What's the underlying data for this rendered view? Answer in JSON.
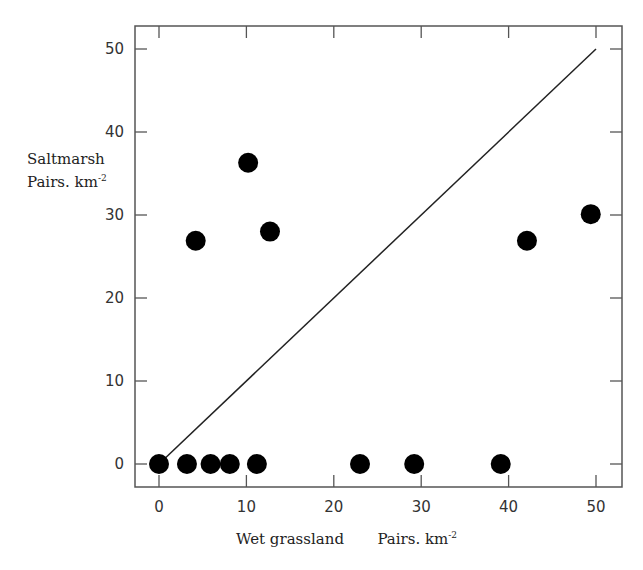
{
  "chart_data": {
    "type": "scatter",
    "title": "",
    "xlabel": "Wet grassland",
    "xlabel_units": "Pairs. km",
    "xlabel_units_sup": "-2",
    "ylabel": "Saltmarsh",
    "ylabel_units": "Pairs. km",
    "ylabel_units_sup": "-2",
    "xlim": [
      -2.8,
      53.0
    ],
    "ylim": [
      -2.8,
      52.6
    ],
    "xticks": [
      0,
      10,
      20,
      30,
      40,
      50
    ],
    "yticks": [
      0,
      10,
      20,
      30,
      40,
      50
    ],
    "grid": false,
    "legend": null,
    "series": [
      {
        "name": "Sites",
        "marker": "filled-circle",
        "color": "#000000",
        "points": [
          {
            "x": 0,
            "y": 0
          },
          {
            "x": 3.2,
            "y": 0
          },
          {
            "x": 5.9,
            "y": 0
          },
          {
            "x": 8.1,
            "y": 0
          },
          {
            "x": 11.2,
            "y": 0
          },
          {
            "x": 23.0,
            "y": 0
          },
          {
            "x": 29.2,
            "y": 0
          },
          {
            "x": 39.1,
            "y": 0
          },
          {
            "x": 4.2,
            "y": 26.9
          },
          {
            "x": 10.2,
            "y": 36.3
          },
          {
            "x": 12.7,
            "y": 28.0
          },
          {
            "x": 42.1,
            "y": 26.9
          },
          {
            "x": 49.4,
            "y": 30.1
          }
        ]
      }
    ],
    "reference_line": {
      "label": "y = x",
      "from": [
        0,
        0
      ],
      "to": [
        50,
        50
      ],
      "color": "#222222"
    }
  }
}
